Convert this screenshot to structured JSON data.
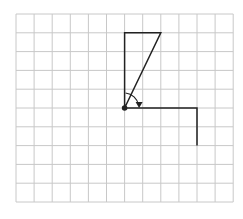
{
  "diagram": {
    "grid": {
      "cols": 12,
      "rows": 10,
      "x0": 16,
      "y0": 14,
      "cell_w": 18.1,
      "cell_h": 18.8,
      "color": "#c8c8c8"
    },
    "shape_color": "#222222",
    "center_point": {
      "col": 6,
      "row": 5
    },
    "figure_original": {
      "description": "right triangle: vertical edge from center up 4 cells, top edge 2 cells right, hypotenuse back to center",
      "points": [
        [
          6,
          5
        ],
        [
          6,
          1
        ],
        [
          8,
          1
        ]
      ]
    },
    "figure_rotated": {
      "description": "L-shape: horizontal edge 4 cells right from center, vertical edge 2 cells down",
      "points": [
        [
          6,
          5
        ],
        [
          10,
          5
        ],
        [
          10,
          7
        ]
      ]
    },
    "rotation_arrow": {
      "direction": "clockwise",
      "angle_deg": 90
    }
  }
}
